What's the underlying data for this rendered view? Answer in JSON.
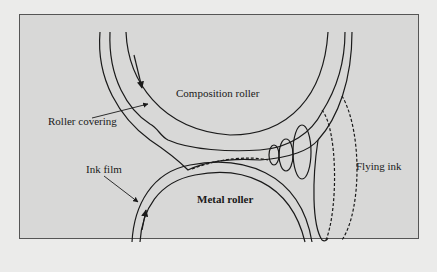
{
  "figure": {
    "labels": {
      "composition_roller": "Composition roller",
      "roller_covering": "Roller covering",
      "ink_film": "Ink film",
      "metal_roller": "Metal roller",
      "flying_ink": "Flying ink"
    },
    "colors": {
      "panel_fill": "#d8d8d7",
      "stroke": "#1a1a1a",
      "page_bg": "#ebebea"
    }
  }
}
